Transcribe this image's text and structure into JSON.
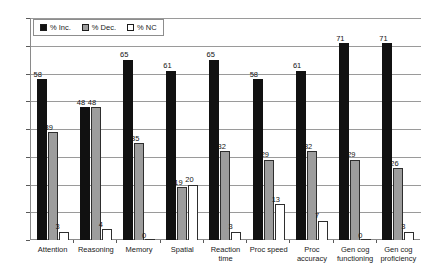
{
  "chart_data": {
    "type": "bar",
    "title": "",
    "xlabel": "",
    "ylabel": "",
    "ylim": [
      0,
      80
    ],
    "ytick_step": 10,
    "yticks": [
      80,
      70,
      60,
      50,
      40,
      30,
      20,
      10,
      0
    ],
    "grid": true,
    "legend_position": "top-left-inside",
    "categories": [
      "Attention",
      "Reasoning",
      "Memory",
      "Spatial",
      "Reaction time",
      "Proc speed",
      "Proc accuracy",
      "Gen cog functioning",
      "Gen cog proficiency"
    ],
    "series": [
      {
        "name": "% Inc.",
        "color": "#111111",
        "values": [
          58,
          48,
          65,
          61,
          65,
          58,
          61,
          71,
          71
        ]
      },
      {
        "name": "% Dec.",
        "color": "#9d9d9d",
        "values": [
          39,
          48,
          35,
          19,
          32,
          29,
          32,
          29,
          26
        ]
      },
      {
        "name": "% NC",
        "color": "#ffffff",
        "values": [
          3,
          4,
          0,
          20,
          3,
          13,
          7,
          0,
          3
        ]
      }
    ]
  },
  "legend": {
    "items": [
      {
        "label": "% Inc.",
        "swatch": "black-square-icon"
      },
      {
        "label": "% Dec.",
        "swatch": "gray-square-icon"
      },
      {
        "label": "% NC",
        "swatch": "white-square-icon"
      }
    ]
  }
}
